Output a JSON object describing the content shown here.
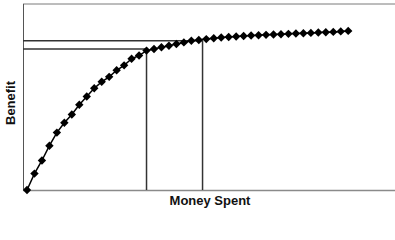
{
  "chart_data": {
    "type": "line",
    "title": "",
    "xlabel": "Money Spent",
    "ylabel": "Benefit",
    "x_ticks": [],
    "y_ticks": [],
    "grid": false,
    "legend": null,
    "marker": "diamond",
    "series": [
      {
        "name": "Benefit",
        "x": [
          0,
          1,
          2,
          3,
          4,
          5,
          6,
          7,
          8,
          9,
          10,
          11,
          12,
          13,
          14,
          15,
          16,
          17,
          18,
          19,
          20,
          21,
          22,
          23,
          24,
          25,
          26,
          27,
          28,
          29,
          30,
          31,
          32,
          33,
          34,
          35,
          36,
          37,
          38,
          39,
          40,
          41,
          42,
          43
        ],
        "values": [
          0,
          10,
          18,
          27,
          35,
          41,
          46,
          52,
          57,
          62,
          66,
          69,
          73,
          76,
          80,
          82,
          85,
          86,
          87,
          88,
          89,
          90,
          91,
          91.5,
          92,
          92.5,
          93,
          93.3,
          93.6,
          93.9,
          94.2,
          94.4,
          94.6,
          94.8,
          95,
          95.2,
          95.4,
          95.6,
          95.8,
          96,
          96.2,
          96.4,
          96.7,
          97
        ]
      }
    ],
    "reference_lines": [
      {
        "orientation": "vertical",
        "x": 16,
        "from_y": 0,
        "to_y": 86,
        "label": ""
      },
      {
        "orientation": "horizontal",
        "y": 86,
        "from_x": 0,
        "to_x": 16,
        "label": ""
      },
      {
        "orientation": "vertical",
        "x": 23.5,
        "from_y": 0,
        "to_y": 91,
        "label": ""
      },
      {
        "orientation": "horizontal",
        "y": 91,
        "from_x": 0,
        "to_x": 23.5,
        "label": ""
      }
    ],
    "xlim": [
      0,
      48
    ],
    "ylim": [
      0,
      100
    ]
  },
  "labels": {
    "x_axis": "Money Spent",
    "y_axis": "Benefit"
  },
  "colors": {
    "axis": "#555555",
    "line": "#000000",
    "marker": "#000000",
    "reference": "#333333"
  }
}
